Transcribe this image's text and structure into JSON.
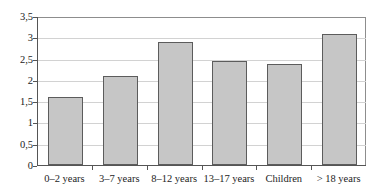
{
  "chart_data": {
    "type": "bar",
    "title": "",
    "subtitle": "",
    "xlabel": "",
    "ylabel": "",
    "categories": [
      "0–2 years",
      "3–7 years",
      "8–12 years",
      "13–17 years",
      "Children",
      "> 18 years"
    ],
    "values": [
      1.6,
      2.08,
      2.9,
      2.45,
      2.38,
      3.07
    ],
    "ylim": [
      0,
      3.5
    ],
    "ytick_values": [
      0,
      0.5,
      1,
      1.5,
      2,
      2.5,
      3,
      3.5
    ],
    "ytick_labels": [
      "0",
      "0,5",
      "1",
      "1,5",
      "2",
      "2,5",
      "3",
      "3,5"
    ],
    "decimal_separator": ",",
    "grid": "horizontal",
    "legend": "none",
    "annotations": [],
    "series": [
      {
        "name": "",
        "values": [
          1.6,
          2.08,
          2.9,
          2.45,
          2.38,
          3.07
        ]
      }
    ],
    "style": {
      "bar_fill": "#c6c6c6",
      "bar_border": "#5c5c5c",
      "gridline_color": "#d2d2d2",
      "axis_color": "#555555",
      "frame_color": "#8d8d8d",
      "text_color": "#1d1d1d",
      "background": "#ffffff"
    }
  }
}
